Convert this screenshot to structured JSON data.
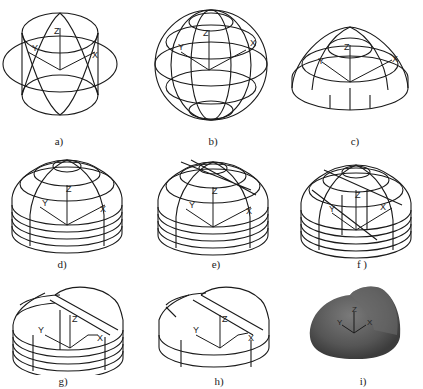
{
  "figure": {
    "line_color": "#1a1a1a",
    "background": "#ffffff",
    "panels": [
      {
        "id": "a",
        "label": "a)",
        "desc": "Intersecting ellipses/cylinders with UCS axes",
        "axes": {
          "x": "X",
          "y": "Y",
          "z": "Z"
        }
      },
      {
        "id": "b",
        "label": "b)",
        "desc": "Spherical wireframe with latitude rings",
        "axes": {
          "x": "X",
          "y": "Y",
          "z": "Z"
        }
      },
      {
        "id": "c",
        "label": "c)",
        "desc": "Hemisphere wireframe (upper half)",
        "axes": {
          "x": "X",
          "y": "Y",
          "z": "Z"
        }
      },
      {
        "id": "d",
        "label": "d)",
        "desc": "Hemisphere with dense latitude rings",
        "axes": {
          "x": "X",
          "y": "Y",
          "z": "Z"
        }
      },
      {
        "id": "e",
        "label": "e)",
        "desc": "Hemisphere with added cutting edges",
        "axes": {
          "x": "X",
          "y": "Y",
          "z": "Z"
        }
      },
      {
        "id": "f",
        "label": "f )",
        "desc": "Hemisphere with sloped cutting plane construction",
        "axes": {
          "x": "X",
          "y": "Y",
          "z": "Z"
        }
      },
      {
        "id": "g",
        "label": "g)",
        "desc": "Hemisphere trimmed by inclined plane",
        "axes": {
          "x": "X",
          "y": "Y",
          "z": "Z"
        }
      },
      {
        "id": "h",
        "label": "h)",
        "desc": "Trimmed hemisphere with fewer rings",
        "axes": {
          "x": "X",
          "y": "Y",
          "z": "Z"
        }
      },
      {
        "id": "i",
        "label": "i)",
        "desc": "Shaded solid of the trimmed dome",
        "axes": {
          "x": "X",
          "y": "Y",
          "z": "Z"
        },
        "fill_color": "#5a5a5a"
      }
    ]
  }
}
